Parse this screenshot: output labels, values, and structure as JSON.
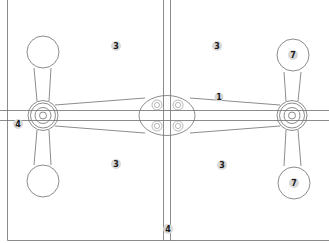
{
  "diagram": {
    "title": "",
    "colors": {
      "line": "#6f6f6f",
      "badge_fill": "#d9d9d9",
      "badge_text": "#1a1a1a",
      "background": "#ffffff"
    },
    "callouts": [
      {
        "id": "callout-3-top-left",
        "label": "3",
        "x": 116,
        "y": 46
      },
      {
        "id": "callout-3-top-right",
        "label": "3",
        "x": 217,
        "y": 46
      },
      {
        "id": "callout-7-top-right",
        "label": "7",
        "x": 293,
        "y": 55
      },
      {
        "id": "callout-1-arm",
        "label": "1",
        "x": 219,
        "y": 97
      },
      {
        "id": "callout-4-left",
        "label": "4",
        "x": 18,
        "y": 124
      },
      {
        "id": "callout-3-bottom-left",
        "label": "3",
        "x": 116,
        "y": 164
      },
      {
        "id": "callout-3-bottom-right",
        "label": "3",
        "x": 222,
        "y": 165
      },
      {
        "id": "callout-7-bottom-right",
        "label": "7",
        "x": 294,
        "y": 183
      },
      {
        "id": "callout-4-bottom",
        "label": "4",
        "x": 168,
        "y": 229
      }
    ],
    "components": {
      "glass_panes": 4,
      "pivot_hubs": 2,
      "disc_arms": 4,
      "central_bolts": 4
    }
  }
}
